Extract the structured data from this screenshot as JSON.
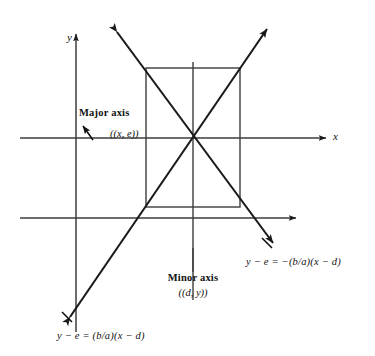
{
  "figure": {
    "type": "geometry-diagram",
    "background_color": "#ffffff",
    "line_color": "#1a1a1a",
    "thin_line_color": "#4a4a4a"
  },
  "axes": {
    "x_label": "x",
    "y_label": "y",
    "x_axis": {
      "y": 138,
      "x_start": 20,
      "x_end": 330,
      "arrow": "right"
    },
    "y_axis": {
      "x": 76,
      "y_start": 332,
      "y_end": 30,
      "arrow": "up"
    },
    "secondary_x_axis": {
      "y": 218,
      "x_start": 20,
      "x_end": 300,
      "arrow": "right"
    },
    "secondary_y_axis": {
      "x": 193,
      "y_start": 300,
      "y_end": 62,
      "arrow": "none"
    }
  },
  "rectangle": {
    "left": 146,
    "right": 240,
    "top": 68,
    "bottom": 207,
    "center_x": 193,
    "center_y": 138
  },
  "annotations": {
    "major_axis": {
      "title": "Major axis",
      "coord": "((x, e))",
      "pointer": "arrow-up-left"
    },
    "minor_axis": {
      "title": "Minor axis",
      "coord": "((d, y))",
      "pointer": "vertical-line"
    }
  },
  "equations": {
    "positive_slope": "y − e = (b/a)(x − d)",
    "negative_slope": "y − e = −(b/a)(x − d)"
  },
  "asymptotes": [
    {
      "name": "positive-slope-asymptote",
      "from": {
        "x": 66,
        "y": 323
      },
      "to": {
        "x": 271,
        "y": 24
      },
      "arrows": "both"
    },
    {
      "name": "negative-slope-asymptote",
      "from": {
        "x": 113,
        "y": 27
      },
      "to": {
        "x": 277,
        "y": 248
      },
      "arrows": "both"
    }
  ]
}
